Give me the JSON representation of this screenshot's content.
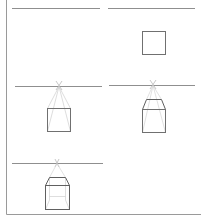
{
  "diagram": {
    "title": "",
    "type": "one-point perspective box construction steps",
    "colors": {
      "frame": "#9a9a9a",
      "horizon": "#8f8f8f",
      "box": "#707070",
      "guide": "#cfcfcf"
    },
    "panels": [
      {
        "id": "step-1",
        "label": "",
        "horizon": {
          "x1": 12,
          "x2": 100,
          "y": 8
        },
        "has_box": false
      },
      {
        "id": "step-2",
        "label": "",
        "horizon": {
          "x1": 108,
          "x2": 195,
          "y": 8
        },
        "box": {
          "x": 142,
          "y": 31,
          "w": 23,
          "h": 23
        }
      },
      {
        "id": "step-3",
        "label": "",
        "horizon": {
          "x1": 15,
          "x2": 102,
          "y": 86
        },
        "vp": {
          "x": 59,
          "y": 86
        },
        "box": {
          "x": 47,
          "y": 108,
          "w": 23,
          "h": 23
        }
      },
      {
        "id": "step-4",
        "label": "",
        "horizon": {
          "x1": 109,
          "x2": 195,
          "y": 85
        },
        "vp": {
          "x": 153,
          "y": 85
        },
        "box": {
          "x": 142,
          "y": 109,
          "w": 23,
          "h": 23
        },
        "top_back": {
          "x1": 146,
          "x2": 161,
          "y": 99
        }
      },
      {
        "id": "step-5",
        "label": "",
        "horizon": {
          "x1": 12,
          "x2": 103,
          "y": 163
        },
        "vp": {
          "x": 57,
          "y": 163
        },
        "box": {
          "x": 45,
          "y": 185,
          "w": 24,
          "h": 24
        },
        "top_back": {
          "x1": 49,
          "x2": 65,
          "y": 177
        }
      }
    ]
  }
}
